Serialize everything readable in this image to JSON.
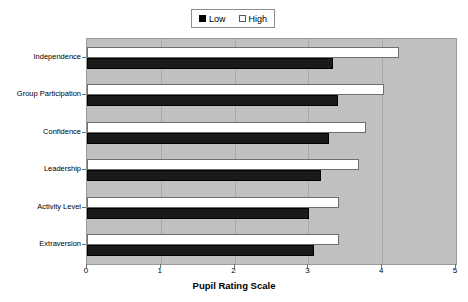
{
  "chart_data": {
    "type": "bar",
    "orientation": "horizontal",
    "title": "",
    "xlabel": "Pupil Rating Scale",
    "ylabel": "",
    "xlim": [
      0,
      5
    ],
    "xticks": [
      "0",
      "1",
      "2",
      "3",
      "4",
      "5"
    ],
    "grid": true,
    "legend_position": "top-center",
    "categories": [
      "Independence",
      "Group Participation",
      "Confidence",
      "Leadership",
      "Activity Level",
      "Extraversion"
    ],
    "series": [
      {
        "name": "Low",
        "color": "#000000",
        "values": [
          3.33,
          3.4,
          3.28,
          3.17,
          3.01,
          3.08
        ]
      },
      {
        "name": "High",
        "color": "#ffffff",
        "values": [
          4.23,
          4.02,
          3.78,
          3.69,
          3.41,
          3.41
        ]
      }
    ]
  },
  "legend": {
    "entries": [
      {
        "label": "Low",
        "swatch": "filled-square-icon"
      },
      {
        "label": "High",
        "swatch": "empty-square-icon"
      }
    ]
  },
  "colors": {
    "plot_background": "#c0c0c0",
    "page_background": "#ffffff",
    "gridline": "#a8a8a8",
    "axis": "#6e6e6e",
    "low_bar": "#1a1a1a",
    "high_bar": "#ffffff"
  }
}
